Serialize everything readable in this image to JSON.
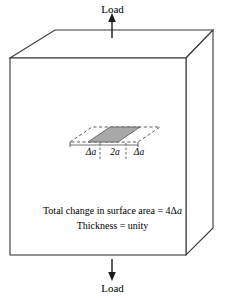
{
  "figure": {
    "colors": {
      "outline": "#3a3a3a",
      "crack_fill": "#a8a8a8",
      "crack_edge": "#555555",
      "dashed_plane": "#4a4a4a",
      "arrow": "#1a1a1a",
      "background": "#ffffff"
    }
  },
  "loads": {
    "top_label": "Load",
    "bottom_label": "Load"
  },
  "dimensions": {
    "left_increment": "Δa",
    "crack_length": "2a",
    "right_increment": "Δa"
  },
  "caption": {
    "line1_prefix": "Total change in surface area = 4Δ",
    "line1_italic": "a",
    "line2": "Thickness = unity"
  },
  "icons": {
    "up_arrow": "load-arrow-up-icon",
    "down_arrow": "load-arrow-down-icon",
    "crack": "crack-parallelogram-icon",
    "crack_plane": "crack-plane-dashed-icon",
    "block": "block-3d-icon"
  }
}
